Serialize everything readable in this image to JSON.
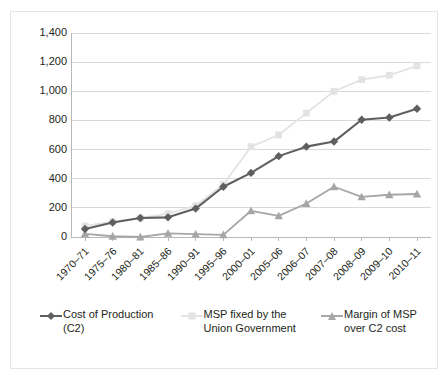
{
  "chart_data": {
    "type": "line",
    "title": "",
    "subtitle": "",
    "xlabel": "",
    "ylabel": "",
    "ylim": [
      0,
      1400
    ],
    "ytick_values": [
      1400,
      1200,
      1000,
      800,
      600,
      400,
      200,
      0
    ],
    "ytick_labels": [
      "1,400",
      "1,200",
      "1,000",
      "800",
      "600",
      "400",
      "200",
      "0"
    ],
    "grid": true,
    "grid_axis": "y",
    "legend_position": "bottom",
    "categories": [
      "1970–71",
      "1975–76",
      "1980–81",
      "1985–86",
      "1990–91",
      "1995–96",
      "2000–01",
      "2005–06",
      "2006–07",
      "2007–08",
      "2008–09",
      "2009–10",
      "2010–11"
    ],
    "series": [
      {
        "name": "Cost of Production (C2)",
        "legend_label": "Cost of Production (C2)",
        "color": "#5f5f5f",
        "marker": "diamond",
        "values": [
          55,
          100,
          130,
          135,
          195,
          345,
          440,
          555,
          620,
          655,
          805,
          820,
          880
        ]
      },
      {
        "name": "MSP fixed by the Union Government",
        "legend_label": "MSP fixed by the Union Government",
        "color": "#e3e3e3",
        "marker": "square",
        "values": [
          76,
          105,
          130,
          160,
          215,
          360,
          620,
          700,
          850,
          1000,
          1080,
          1110,
          1175
        ]
      },
      {
        "name": "Margin of MSP over C2 cost",
        "legend_label": "Margin of MSP over C2 cost",
        "color": "#a6a6a6",
        "marker": "triangle",
        "values": [
          21,
          5,
          0,
          25,
          20,
          15,
          180,
          145,
          230,
          345,
          275,
          290,
          295
        ]
      }
    ]
  },
  "legend": {
    "entries": [
      {
        "label": "Cost of Production (C2)",
        "marker": "diamond-marker-icon"
      },
      {
        "label": "MSP fixed by the Union Government",
        "marker": "square-marker-icon"
      },
      {
        "label": "Margin of MSP over C2 cost",
        "marker": "triangle-marker-icon"
      }
    ]
  }
}
